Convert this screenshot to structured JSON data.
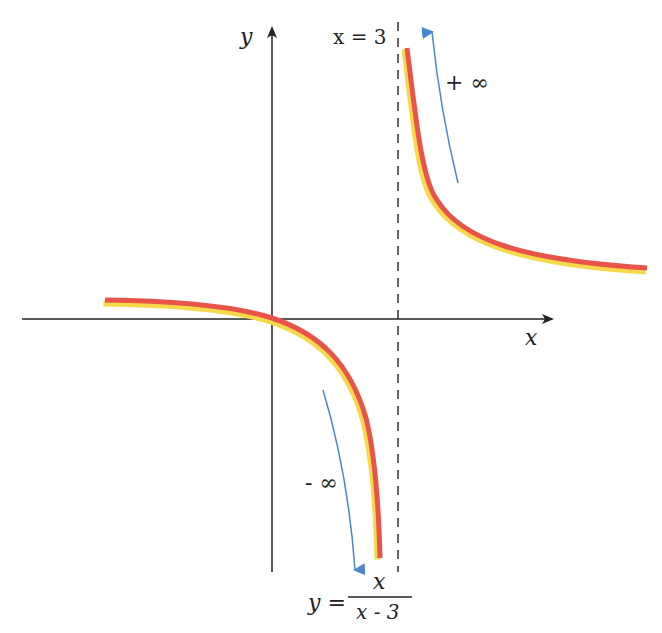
{
  "figure": {
    "function": "y = x / (x - 3)",
    "labels": {
      "y_axis": "y",
      "x_axis": "x",
      "asymptote": "x = 3",
      "plus_infinity": "+ ∞",
      "minus_infinity": "- ∞",
      "formula_lhs": "y =",
      "formula_num": "x",
      "formula_den": "x - 3"
    },
    "colors": {
      "curve": "#e8544a",
      "curve_highlight": "#f5d94a",
      "arrow": "#4a86d0",
      "axis": "#222222",
      "asymptote": "#222222"
    },
    "vertical_asymptote": 3,
    "horizontal_asymptote": 1
  }
}
